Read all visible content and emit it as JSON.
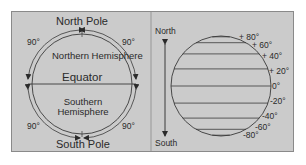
{
  "left_panel": {
    "north_pole": "North Pole",
    "south_pole": "South Pole",
    "northern_hemisphere": "Northern Hemisphere",
    "southern_hemisphere": "Southern Hemisphere",
    "equator": "Equator",
    "angles": {
      "top_left": "90°",
      "top_right": "90°",
      "bottom_left": "90°",
      "bottom_right": "90°"
    }
  },
  "right_panel": {
    "north": "North",
    "south": "South",
    "latitudes": [
      "+ 80°",
      "+ 60°",
      "+ 40°",
      "+ 20°",
      "0°",
      "-20°",
      "-40°",
      "-60°",
      "-80°"
    ]
  },
  "colors": {
    "background": "#cbcbcb",
    "line": "#3a3a3a",
    "text": "#2a2a2a",
    "border": "#8a8a8a"
  }
}
